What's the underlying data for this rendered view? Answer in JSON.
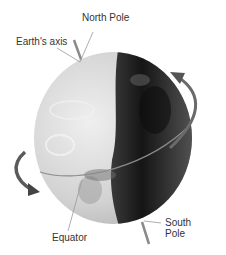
{
  "diagram": {
    "labels": {
      "north_pole": "North Pole",
      "earths_axis": "Earth's axis",
      "equator": "Equator",
      "south_pole_line1": "South",
      "south_pole_line2": "Pole"
    },
    "colors": {
      "background": "#ffffff",
      "day_side": "#d8d8d8",
      "night_side": "#1e1e1e",
      "arrow": "#555555",
      "leader_line": "#999999",
      "text": "#333333"
    }
  }
}
